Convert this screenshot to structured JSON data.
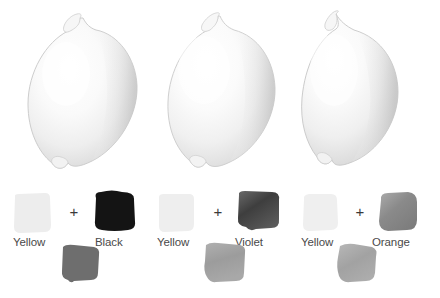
{
  "illustration": {
    "kind": "color-mixing-lemon-study",
    "background_color": "#ffffff"
  },
  "lemons": [
    {
      "name": "lemon-yellow-black",
      "body_color": "#f2f2f2",
      "shadow_color": "#d9d9d9",
      "highlight_color": "#ffffff",
      "outline_color": "#c9c9c9"
    },
    {
      "name": "lemon-yellow-violet",
      "body_color": "#f4f4f4",
      "shadow_color": "#dcdcdc",
      "highlight_color": "#ffffff",
      "outline_color": "#cccccc"
    },
    {
      "name": "lemon-yellow-orange",
      "body_color": "#f3f3f3",
      "shadow_color": "#dadada",
      "highlight_color": "#ffffff",
      "outline_color": "#cacaca"
    }
  ],
  "mixes": [
    {
      "id": "yellow-black",
      "operator": "+",
      "base": {
        "label": "Yellow",
        "color": "#ededed"
      },
      "mixer": {
        "label": "Black",
        "color": "#141414"
      },
      "result": {
        "color": "#6e6e6e"
      }
    },
    {
      "id": "yellow-violet",
      "operator": "+",
      "base": {
        "label": "Yellow",
        "color": "#eeeeee"
      },
      "mixer": {
        "label": "Violet",
        "color": "#4a4a4a"
      },
      "result": {
        "color": "#a0a0a0"
      }
    },
    {
      "id": "yellow-orange",
      "operator": "+",
      "base": {
        "label": "Yellow",
        "color": "#efefef"
      },
      "mixer": {
        "label": "Orange",
        "color": "#8c8c8c"
      },
      "result": {
        "color": "#a8a8a8"
      }
    }
  ]
}
